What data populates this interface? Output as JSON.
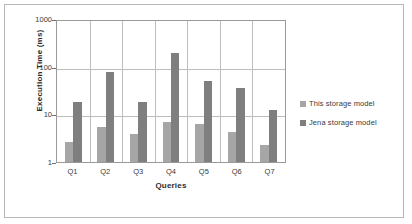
{
  "chart_data": {
    "type": "bar",
    "title": "",
    "xlabel": "Queries",
    "ylabel": "Execution Time (ms)",
    "categories": [
      "Q1",
      "Q2",
      "Q3",
      "Q4",
      "Q5",
      "Q6",
      "Q7"
    ],
    "yscale": "log",
    "ylim": [
      1,
      1000
    ],
    "yticks": [
      1,
      10,
      100,
      1000
    ],
    "ytick_labels": [
      "1",
      "10",
      "100",
      "1000"
    ],
    "grid": true,
    "legend_position": "right",
    "series": [
      {
        "name": "This storage model",
        "color": "#a6a6a6",
        "values": [
          2.6,
          5.5,
          3.8,
          7.0,
          6.3,
          4.2,
          2.3
        ]
      },
      {
        "name": "Jena storage model",
        "color": "#7f7f7f",
        "values": [
          18.0,
          78.0,
          18.5,
          190.0,
          50.0,
          36.0,
          12.5
        ]
      }
    ]
  },
  "legend": {
    "items": [
      {
        "label": "This storage model",
        "swatch": "legend-swatch-this-storage-model"
      },
      {
        "label": "Jena storage model",
        "swatch": "legend-swatch-jena-storage-model"
      }
    ]
  }
}
